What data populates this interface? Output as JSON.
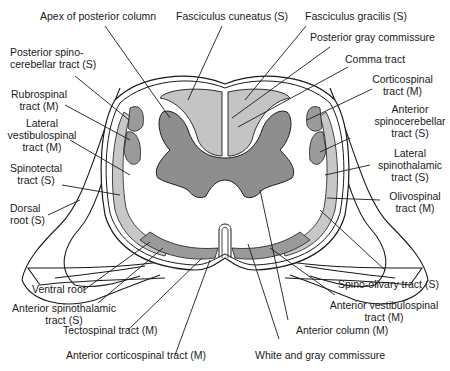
{
  "figure": {
    "colors": {
      "background": "#ffffff",
      "outline": "#1a1a1a",
      "gray_matter": "#8e8e8e",
      "posterior_columns": "#c4c4c4",
      "tract_dark": "#9a9a9a",
      "tract_light": "#c8c8c8",
      "white_matter": "#ffffff"
    }
  },
  "labels": {
    "apex_posterior_column": "Apex of posterior column",
    "fasciculus_cuneatus": "Fasciculus cuneatus (S)",
    "fasciculus_gracilis": "Fasciculus gracilis (S)",
    "posterior_gray_commissure": "Posterior gray commissure",
    "comma_tract": "Comma tract",
    "corticospinal_1": "Corticospinal",
    "corticospinal_2": "tract (M)",
    "posterior_spinocerebellar_1": "Posterior spino-",
    "posterior_spinocerebellar_2": "cerebellar tract (S)",
    "rubrospinal_1": "Rubrospinal",
    "rubrospinal_2": "tract (M)",
    "lateral_vestibulospinal_1": "Lateral",
    "lateral_vestibulospinal_2": "vestibulospinal",
    "lateral_vestibulospinal_3": "tract (M)",
    "anterior_spinocerebellar_1": "Anterior",
    "anterior_spinocerebellar_2": "spinocerebellar",
    "anterior_spinocerebellar_3": "tract (S)",
    "spinotectal_1": "Spinotectal",
    "spinotectal_2": "tract (S)",
    "lateral_spinothalamic_1": "Lateral",
    "lateral_spinothalamic_2": "spinothalamic",
    "lateral_spinothalamic_3": "tract (S)",
    "dorsal_root_1": "Dorsal",
    "dorsal_root_2": "root (S)",
    "olivospinal_1": "Olivospinal",
    "olivospinal_2": "tract (M)",
    "ventral_root": "Ventral root",
    "spino_olivary": "Spino-olivary tract (S)",
    "anterior_spinothalamic_1": "Anterior spinothalamic",
    "anterior_spinothalamic_2": "tract (S)",
    "anterior_vestibulospinal_1": "Anterior vestibulospinal",
    "anterior_vestibulospinal_2": "tract (M)",
    "tectospinal": "Tectospinal tract (M)",
    "anterior_column": "Anterior column (M)",
    "anterior_corticospinal": "Anterior corticospinal tract (M)",
    "white_gray_commissure": "White and gray commissure"
  }
}
